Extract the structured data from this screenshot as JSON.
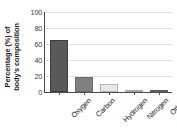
{
  "chart_data": {
    "type": "bar",
    "title": "",
    "xlabel": "",
    "ylabel_line1": "Percentage (%) of",
    "ylabel_line2": "body's composition",
    "categories": [
      "Oxygen",
      "Carbon",
      "Hydrogen",
      "Nitrogen",
      "Other*"
    ],
    "values": [
      65,
      19,
      9.5,
      2,
      3
    ],
    "ylim": [
      0,
      100
    ],
    "yticks": [
      0,
      20,
      40,
      60,
      80,
      100
    ],
    "ytick_labels": [
      "0",
      "20",
      "40",
      "60",
      "80",
      "100"
    ],
    "grid": true,
    "legend": "none",
    "bar_colors": [
      "#595959",
      "#808080",
      "#e8e8e8",
      "#c4c4c4",
      "#7d7d7d"
    ],
    "bar_edge_colors": [
      "#3d3d3d",
      "#6a6a6a",
      "#b5b5b5",
      "#a8a8a8",
      "#5e5e5e"
    ],
    "axis_color": "#4d4d4d",
    "grid_color": "#e3e3e3",
    "background_color": "#ffffff"
  }
}
